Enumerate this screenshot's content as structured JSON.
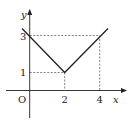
{
  "figure": {
    "type": "function-graph",
    "function": "y = |x - 2| + 1",
    "axes": {
      "x_label": "x",
      "y_label": "y",
      "origin_label": "O"
    },
    "x_ticks": [
      {
        "value": 2,
        "label": "2"
      },
      {
        "value": 4,
        "label": "4"
      }
    ],
    "y_ticks": [
      {
        "value": 1,
        "label": "1"
      },
      {
        "value": 3,
        "label": "3"
      }
    ],
    "points": [
      {
        "x": -0.4,
        "y": 3.4
      },
      {
        "x": 2,
        "y": 1
      },
      {
        "x": 4.4,
        "y": 3.4
      }
    ],
    "guide_lines": [
      {
        "from": [
          0,
          1
        ],
        "to": [
          2,
          1
        ],
        "style": "dashed"
      },
      {
        "from": [
          2,
          1
        ],
        "to": [
          2,
          0
        ],
        "style": "dashed"
      },
      {
        "from": [
          0,
          3
        ],
        "to": [
          4,
          3
        ],
        "style": "dashed"
      },
      {
        "from": [
          4,
          3
        ],
        "to": [
          4,
          0
        ],
        "style": "dashed"
      }
    ],
    "colors": {
      "line": "#222222",
      "axes": "#222222",
      "guides": "#666666"
    }
  }
}
